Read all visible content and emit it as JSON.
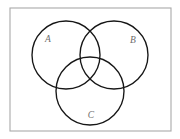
{
  "figure": {
    "type": "venn-diagram",
    "title": "",
    "canvas": {
      "width": 180,
      "height": 139,
      "background": "#ffffff"
    },
    "frame": {
      "name": "figure-border",
      "x": 10,
      "y": 8,
      "width": 161,
      "height": 123,
      "stroke_color": "#a9a9a9",
      "fill_color": "#ffffff",
      "stroke_width": 1.1
    },
    "stroke_color": "#161616",
    "label_color": "#6d6d6d",
    "sets": [
      {
        "id": "A",
        "label": "A",
        "cx": 66,
        "cy": 55,
        "r": 34,
        "label_x": 48,
        "label_y": 40
      },
      {
        "id": "B",
        "label": "B",
        "cx": 114,
        "cy": 55,
        "r": 34,
        "label_x": 133,
        "label_y": 41
      },
      {
        "id": "C",
        "label": "C",
        "cx": 90,
        "cy": 91,
        "r": 34,
        "label_x": 91,
        "label_y": 116
      }
    ]
  }
}
